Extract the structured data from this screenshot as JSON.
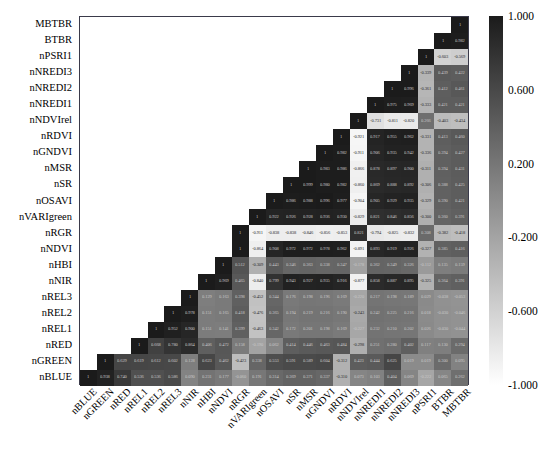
{
  "chart_data": {
    "type": "heatmap",
    "title": "",
    "xlabel": "",
    "ylabel": "",
    "grid": false,
    "legend_position": "right",
    "colormap": "grayscale",
    "colorbar": {
      "min": -1.0,
      "max": 1.0,
      "tick_labels": [
        "1.000",
        "0.600",
        "0.200",
        "-0.200",
        "-0.600",
        "-1.000"
      ],
      "tick_values": [
        1.0,
        0.6,
        0.2,
        -0.2,
        -0.6,
        -1.0
      ],
      "high_color": "#1b1b1b",
      "low_color": "#ffffff"
    },
    "triangle": "lower",
    "x_categories": [
      "nBLUE",
      "nGREEN",
      "nRED",
      "nREL1",
      "nREL2",
      "nREL3",
      "nNIR",
      "nHBI",
      "nNDVI",
      "nRGR",
      "nVARIgreen",
      "nOSAVI",
      "nSR",
      "nMSR",
      "nGNDVI",
      "nRDVI",
      "nNDVIrel",
      "nNREDI1",
      "nNREDI2",
      "nNREDI3",
      "nPSRI1",
      "BTBR",
      "MBTBR"
    ],
    "y_categories": [
      "MBTBR",
      "BTBR",
      "nPSRI1",
      "nNREDI3",
      "nNREDI2",
      "nNREDI1",
      "nNDVIrel",
      "nRDVI",
      "nGNDVI",
      "nMSR",
      "nSR",
      "nOSAVI",
      "nVARIgreen",
      "nRGR",
      "nNDVI",
      "nHBI",
      "nNIR",
      "nREL3",
      "nREL2",
      "nREL1",
      "nRED",
      "nGREEN",
      "nBLUE"
    ],
    "rows": [
      {
        "label": "MBTBR",
        "values": [
          "1"
        ]
      },
      {
        "label": "BTBR",
        "values": [
          "1",
          "0.982"
        ]
      },
      {
        "label": "nPSRI1",
        "values": [
          "1",
          "-0.603",
          "-0.569"
        ]
      },
      {
        "label": "nNREDI3",
        "values": [
          "1",
          "-0.339",
          "0.439",
          "0.422"
        ]
      },
      {
        "label": "nNREDI2",
        "values": [
          "1",
          "0.996",
          "-0.361",
          "0.412",
          "0.461"
        ]
      },
      {
        "label": "nNREDI1",
        "values": [
          "1",
          "0.975",
          "0.969",
          "-0.333",
          "0.421",
          "0.421"
        ]
      },
      {
        "label": "nNDVIrel",
        "values": [
          "1",
          "-0.731",
          "-0.811",
          "-0.820",
          "0.266",
          "-0.403",
          "-0.434"
        ]
      },
      {
        "label": "nRDVI",
        "values": [
          "1",
          "-0.921",
          "0.917",
          "0.955",
          "0.962",
          "-0.331",
          "0.413",
          "0.460"
        ]
      },
      {
        "label": "nGNDVI",
        "values": [
          "1",
          "0.982",
          "-0.911",
          "0.906",
          "0.935",
          "0.942",
          "-0.336",
          "0.394",
          "0.427"
        ]
      },
      {
        "label": "nMSR",
        "values": [
          "1",
          "0.983",
          "0.986",
          "-0.866",
          "0.878",
          "0.897",
          "0.900",
          "-0.311",
          "0.394",
          "0.431"
        ]
      },
      {
        "label": "nSR",
        "values": [
          "1",
          "0.999",
          "0.980",
          "0.982",
          "-0.860",
          "0.869",
          "0.888",
          "0.892",
          "-0.306",
          "0.388",
          "0.425"
        ]
      },
      {
        "label": "nOSAVI",
        "values": [
          "1",
          "0.986",
          "0.988",
          "0.996",
          "0.977",
          "-0.904",
          "0.905",
          "0.929",
          "0.935",
          "-0.329",
          "0.390",
          "0.421"
        ]
      },
      {
        "label": "nVARIgreen",
        "values": [
          "1",
          "0.922",
          "0.926",
          "0.928",
          "0.936",
          "0.930",
          "-0.829",
          "0.821",
          "0.846",
          "0.856",
          "-0.300",
          "0.360",
          "0.391"
        ]
      },
      {
        "label": "nRGR",
        "values": [
          "1",
          "-0.911",
          "-0.838",
          "-0.838",
          "-0.846",
          "-0.856",
          "-0.853",
          "0.821",
          "-0.794",
          "-0.825",
          "-0.832",
          "0.308",
          "-0.382",
          "-0.418"
        ]
      },
      {
        "label": "nNDVI",
        "values": [
          "1",
          "-0.864",
          "0.908",
          "0.972",
          "0.972",
          "0.978",
          "0.962",
          "-0.891",
          "0.893",
          "0.919",
          "0.926",
          "-0.327",
          "0.385",
          "0.416"
        ]
      },
      {
        "label": "nHBI",
        "values": [
          "1",
          "0.512",
          "-0.309",
          "0.443",
          "0.346",
          "0.363",
          "0.338",
          "0.347",
          "-0.178",
          "0.362",
          "0.349",
          "0.326",
          "-0.112",
          "0.135",
          "0.159"
        ]
      },
      {
        "label": "nNIR",
        "values": [
          "1",
          "0.969",
          "0.465",
          "-0.840",
          "0.799",
          "0.943",
          "0.927",
          "0.935",
          "0.916",
          "-0.877",
          "0.858",
          "0.887",
          "0.895",
          "-0.325",
          "0.364",
          "0.391"
        ]
      },
      {
        "label": "nREL3",
        "values": [
          "1",
          "0.129",
          "0.163",
          "0.398",
          "-0.452",
          "0.344",
          "0.176",
          "0.198",
          "0.196",
          "0.169",
          "-0.220",
          "0.217",
          "0.198",
          "0.189",
          "0.029",
          "-0.038",
          "-0.053"
        ]
      },
      {
        "label": "nREL2",
        "values": [
          "1",
          "0.978",
          "0.151",
          "0.165",
          "0.418",
          "-0.476",
          "0.365",
          "0.194",
          "0.219",
          "0.216",
          "0.190",
          "-0.243",
          "0.242",
          "0.225",
          "0.216",
          "0.018",
          "-0.030",
          "-0.046"
        ]
      },
      {
        "label": "nREL1",
        "values": [
          "1",
          "0.952",
          "0.900",
          "0.151",
          "0.141",
          "0.399",
          "-0.463",
          "0.342",
          "0.172",
          "0.201",
          "0.198",
          "0.169",
          "-0.227",
          "0.232",
          "0.210",
          "0.202",
          "0.026",
          "-0.030",
          "-0.044"
        ]
      },
      {
        "label": "nRED",
        "values": [
          "1",
          "0.668",
          "0.780",
          "0.864",
          "0.406",
          "0.472",
          "0.158",
          "-0.190",
          "0.062",
          "0.414",
          "0.446",
          "0.463",
          "0.484",
          "-0.298",
          "0.251",
          "0.280",
          "0.402",
          "0.117",
          "0.130",
          "0.294"
        ]
      },
      {
        "label": "nGREEN",
        "values": [
          "1",
          "0.629",
          "0.619",
          "0.612",
          "0.602",
          "0.128",
          "0.623",
          "0.462",
          "-0.423",
          "0.338",
          "0.553",
          "0.591",
          "0.589",
          "0.604",
          "-0.312",
          "0.423",
          "0.444",
          "0.625",
          "0.019",
          "0.019",
          "0.300",
          "0.095"
        ]
      },
      {
        "label": "nBLUE",
        "values": [
          "1",
          "0.938",
          "0.740",
          "0.536",
          "0.536",
          "0.586",
          "0.090",
          "0.231",
          "0.177",
          "-0.060",
          "0.191",
          "0.314",
          "0.369",
          "0.371",
          "0.337",
          "-0.310",
          "0.073",
          "0.103",
          "0.404",
          "0.069",
          "-0.222",
          "0.065",
          "0.262"
        ]
      }
    ]
  }
}
